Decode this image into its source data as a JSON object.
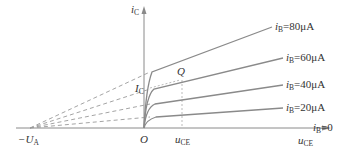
{
  "diagram": {
    "axes": {
      "y_label": {
        "main": "i",
        "sub": "C"
      },
      "x_label": {
        "main": "u",
        "sub": "CE"
      },
      "origin": "O",
      "early_voltage": {
        "main": "−U",
        "sub": "A"
      }
    },
    "curves": [
      {
        "label_main": "i",
        "label_sub": "B",
        "label_value": "=80μA"
      },
      {
        "label_main": "i",
        "label_sub": "B",
        "label_value": "=60μA"
      },
      {
        "label_main": "i",
        "label_sub": "B",
        "label_value": "=40μA"
      },
      {
        "label_main": "i",
        "label_sub": "B",
        "label_value": "=20μA"
      },
      {
        "label_main": "i",
        "label_sub": "B",
        "label_value": "=0"
      }
    ],
    "operating_point": {
      "label": "Q",
      "ic_label": {
        "main": "I",
        "sub": "C"
      },
      "uce_label": {
        "main": "u",
        "sub": "CE"
      }
    },
    "colors": {
      "line": "#8a8a8a",
      "dash": "#9a9a9a",
      "text": "#333333"
    }
  }
}
